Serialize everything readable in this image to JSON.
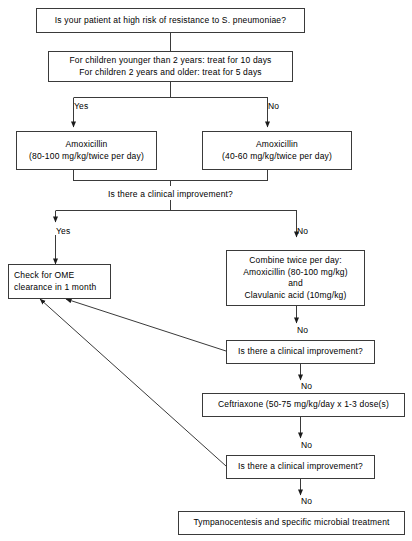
{
  "diagram": {
    "stroke_color": "#3a3a3a",
    "text_color": "#000000",
    "background_color": "#ffffff",
    "nodes": {
      "risk_question": {
        "lines": [
          "Is your patient at high risk of resistance to S. pneumoniae?"
        ]
      },
      "duration": {
        "lines": [
          "For children younger than 2 years: treat for 10 days",
          "For children 2 years and older: treat for 5 days"
        ]
      },
      "amox_high": {
        "lines": [
          "Amoxicillin",
          "(80-100 mg/kg/twice per day)"
        ]
      },
      "amox_low": {
        "lines": [
          "Amoxicillin",
          "(40-60 mg/kg/twice per day)"
        ]
      },
      "improvement_1": {
        "lines": [
          "Is there a clinical improvement?"
        ]
      },
      "check_ome": {
        "lines": [
          "Check for OME",
          "clearance in 1 month"
        ]
      },
      "combine": {
        "lines": [
          "Combine twice per day:",
          "Amoxicillin (80-100 mg/kg)",
          "and",
          "Clavulanic acid (10mg/kg)"
        ]
      },
      "improvement_2": {
        "lines": [
          "Is there a clinical improvement?"
        ]
      },
      "ceftriaxone": {
        "lines": [
          "Ceftriaxone (50-75 mg/kg/day x 1-3 dose(s)"
        ]
      },
      "improvement_3": {
        "lines": [
          "Is there a clinical improvement?"
        ]
      },
      "tympanocentesis": {
        "lines": [
          "Tympanocentesis and specific microbial treatment"
        ]
      }
    },
    "edge_labels": {
      "risk_yes": "Yes",
      "risk_no": "No",
      "improvement1_yes": "Yes",
      "improvement1_no": "No",
      "combine_no": "No",
      "improvement2_no": "No",
      "ceftriaxone_no": "No",
      "improvement3_no": "No"
    }
  }
}
